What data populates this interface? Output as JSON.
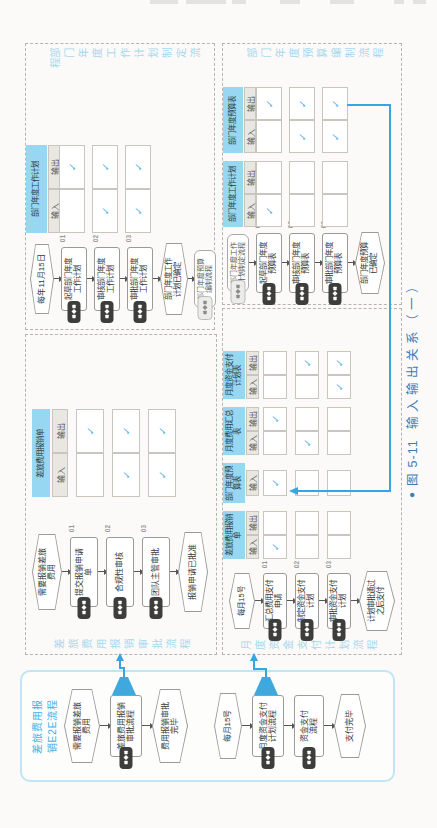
{
  "glyphs": {
    "check": "✓",
    "bullet": "●"
  },
  "caption": {
    "fig": "图 5-11",
    "title": "输入输出关系（一）"
  },
  "colors": {
    "accent_blue": "#36a6e0",
    "header_cyan": "#97d7f1",
    "caption_blue": "#3d7cbc",
    "check_blue": "#5cb1e3",
    "title_blue": "#a8d8ef"
  },
  "io": {
    "input": "输入",
    "output": "输出"
  },
  "e2e": {
    "label": "差旅费用报\n销E2E流程",
    "flow1": {
      "start": "需要报销差旅\n费用",
      "process": "差旅费用报销\n审批流程",
      "end": "费用报销审批\n完毕"
    },
    "flow2": {
      "start": "每月15号",
      "process1": "月度资金支付\n计划流程",
      "process2": "资金支付\n流程",
      "end": "支付完毕"
    }
  },
  "panels": {
    "baoxiao": {
      "title": "差旅费用报销审批流程",
      "start": "需要报销差旅\n费用",
      "steps": [
        {
          "no": "01",
          "label": "提交报销申请\n单"
        },
        {
          "no": "02",
          "label": "合规性审核"
        },
        {
          "no": "03",
          "label": "团队主管审批"
        }
      ],
      "end": "报销申请已批准",
      "tables": [
        {
          "name": "差旅费用报销单",
          "cols": [
            "输入",
            "输出"
          ],
          "checks": [
            [
              false,
              true
            ],
            [
              true,
              true
            ],
            [
              true,
              true
            ]
          ]
        }
      ]
    },
    "zijin": {
      "title": "月度资金支付计划流程",
      "start": "每月15号",
      "steps": [
        {
          "no": "01",
          "label": "汇总费用支付\n申请"
        },
        {
          "no": "02",
          "label": "制定资金支付\n计划"
        },
        {
          "no": "03",
          "label": "审批资金支付\n计划"
        }
      ],
      "end": "计划审批通过\n之后支付",
      "tables": [
        {
          "name": "差旅费用报销单",
          "cols": [
            "输入",
            "输出"
          ],
          "checks": [
            [
              true,
              false
            ],
            [
              false,
              false
            ],
            [
              false,
              false
            ]
          ]
        },
        {
          "name": "部门年度预算表",
          "cols": [
            "输入"
          ],
          "checks": [
            [
              true
            ],
            [
              false
            ],
            [
              false
            ]
          ]
        },
        {
          "name": "月度费用汇总表",
          "cols": [
            "输入",
            "输出"
          ],
          "checks": [
            [
              false,
              true
            ],
            [
              true,
              false
            ],
            [
              false,
              false
            ]
          ]
        },
        {
          "name": "月度资金支付计划表",
          "cols": [
            "输入",
            "输出"
          ],
          "checks": [
            [
              false,
              false
            ],
            [
              false,
              true
            ],
            [
              true,
              true
            ]
          ]
        }
      ]
    },
    "jihua": {
      "title": "部门年度工作计划制定流程",
      "start": "每年11月15日",
      "steps": [
        {
          "no": "01",
          "label": "起草部门年度\n工作计划"
        },
        {
          "no": "02",
          "label": "审核部门年度\n工作计划"
        },
        {
          "no": "03",
          "label": "审批部门年度\n工作计划"
        }
      ],
      "end": "部门年度工作\n计划已确定",
      "link": "部门年度预算\n编制流程",
      "tables": [
        {
          "name": "部门年度工作计划",
          "cols": [
            "输入",
            "输出"
          ],
          "checks": [
            [
              false,
              true
            ],
            [
              true,
              true
            ],
            [
              true,
              true
            ]
          ]
        }
      ]
    },
    "yusuan": {
      "title": "部门年度预算编制流程",
      "link": "部门年度工作\n计划制定流程",
      "steps": [
        {
          "no": "01",
          "label": "起草部门年度\n预算表"
        },
        {
          "no": "02",
          "label": "审核部门年度\n预算表"
        },
        {
          "no": "03",
          "label": "审批部门年度\n预算表"
        }
      ],
      "end": "部门年度预算\n已确定",
      "tables": [
        {
          "name": "部门年度工作计划",
          "cols": [
            "输入",
            "输出"
          ],
          "checks": [
            [
              true,
              false
            ],
            [
              false,
              false
            ],
            [
              false,
              false
            ]
          ]
        },
        {
          "name": "部门年度预算表",
          "cols": [
            "输入",
            "输出"
          ],
          "checks": [
            [
              false,
              true
            ],
            [
              true,
              true
            ],
            [
              true,
              true
            ]
          ]
        }
      ]
    }
  }
}
